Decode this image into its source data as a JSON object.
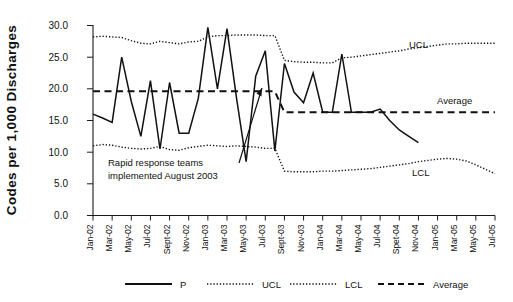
{
  "chart_data": {
    "type": "line",
    "title": "",
    "xlabel": "",
    "ylabel": "Codes per 1,000 Discharges",
    "ylim": [
      0.0,
      30.0
    ],
    "ytick_labels": [
      "0.0",
      "5.0",
      "10.0",
      "15.0",
      "20.0",
      "25.0",
      "30.0"
    ],
    "ytick_values": [
      0.0,
      5.0,
      10.0,
      15.0,
      20.0,
      25.0,
      30.0
    ],
    "grid": false,
    "legend_position": "bottom",
    "categories": [
      "Jan-02",
      "Feb-02",
      "Mar-02",
      "Apr-02",
      "May-02",
      "Jun-02",
      "Jul-02",
      "Aug-02",
      "Sept-02",
      "Oct-02",
      "Nov-02",
      "Dec-02",
      "Jan-03",
      "Feb-03",
      "Mar-03",
      "Apr-03",
      "May-03",
      "Jun-03",
      "Jul-03",
      "Aug-03",
      "Sept-03",
      "Oct-03",
      "Nov-03",
      "Dec-03",
      "Jan-04",
      "Feb-04",
      "Mar-04",
      "Apr-04",
      "May-04",
      "Jun-04",
      "Jul-04",
      "Aug-04",
      "Spet-04",
      "Oct-04",
      "Nov-04",
      "Dec-04",
      "Jan-05",
      "Feb-05",
      "Mar-05",
      "Apr-05",
      "May-05",
      "Jun-05",
      "Jul-05"
    ],
    "xtick_labels": [
      "Jan-02",
      "Mar-02",
      "May-02",
      "Jul-02",
      "Sept-02",
      "Nov-02",
      "Jan-03",
      "Mar-03",
      "May-03",
      "Jul-03",
      "Sept-03",
      "Nov-03",
      "Jan-04",
      "Mar-04",
      "May-04",
      "Jul-04",
      "Spet-04",
      "Nov-04",
      "Jan-05",
      "Mar-05",
      "May-05",
      "Jul-05"
    ],
    "series": [
      {
        "name": "P",
        "style": "solid",
        "values": [
          16.0,
          15.4,
          14.7,
          25.0,
          18.0,
          12.5,
          21.3,
          10.5,
          21.0,
          13.0,
          13.0,
          18.5,
          29.7,
          20.0,
          29.5,
          18.5,
          8.5,
          22.0,
          26.0,
          10.2,
          24.0,
          19.5,
          17.8,
          22.5,
          16.3,
          16.3,
          25.5,
          16.3,
          16.3,
          16.3,
          16.8,
          15.0,
          13.5,
          12.5,
          11.5,
          null,
          null,
          null,
          null,
          null,
          null,
          null,
          null
        ]
      },
      {
        "name": "UCL",
        "style": "dotted",
        "values": [
          28.2,
          28.3,
          28.2,
          28.1,
          27.6,
          27.2,
          27.1,
          27.5,
          27.3,
          27.1,
          27.4,
          27.5,
          28.2,
          28.4,
          28.4,
          28.5,
          28.5,
          28.5,
          28.4,
          28.4,
          24.5,
          24.3,
          24.2,
          24.2,
          24.1,
          24.1,
          24.9,
          25.0,
          25.2,
          25.4,
          25.6,
          25.8,
          26.0,
          26.3,
          26.5,
          26.7,
          26.9,
          27.1,
          27.1,
          27.2,
          27.2,
          27.2,
          27.2
        ]
      },
      {
        "name": "LCL",
        "style": "dotted",
        "values": [
          11.0,
          11.2,
          11.1,
          10.8,
          10.6,
          10.5,
          10.6,
          10.9,
          10.4,
          10.3,
          10.7,
          10.9,
          11.1,
          11.0,
          10.9,
          11.0,
          10.9,
          10.8,
          10.6,
          10.6,
          7.0,
          6.9,
          6.9,
          6.9,
          7.0,
          7.0,
          7.1,
          7.2,
          7.3,
          7.4,
          7.6,
          7.8,
          8.0,
          8.2,
          8.5,
          8.7,
          8.9,
          9.0,
          8.9,
          8.6,
          8.0,
          7.3,
          6.6
        ]
      },
      {
        "name": "Average",
        "style": "dashed",
        "values": [
          19.6,
          19.6,
          19.6,
          19.6,
          19.6,
          19.6,
          19.6,
          19.6,
          19.6,
          19.6,
          19.6,
          19.6,
          19.6,
          19.6,
          19.6,
          19.6,
          19.6,
          19.6,
          19.6,
          19.6,
          16.3,
          16.3,
          16.3,
          16.3,
          16.3,
          16.3,
          16.3,
          16.3,
          16.3,
          16.3,
          16.3,
          16.3,
          16.3,
          16.3,
          16.3,
          16.3,
          16.3,
          16.3,
          16.3,
          16.3,
          16.3,
          16.3,
          16.3
        ]
      }
    ],
    "annotations": [
      {
        "name": "intervention-note",
        "line1": "Rapid response teams",
        "line2": "implemented August 2003",
        "points_to": "Sept-03"
      }
    ],
    "inline_labels": [
      {
        "name": "ucl-label",
        "text": "UCL"
      },
      {
        "name": "average-label",
        "text": "Average"
      },
      {
        "name": "lcl-label",
        "text": "LCL"
      }
    ],
    "legend": [
      {
        "name": "P",
        "style": "solid"
      },
      {
        "name": "UCL",
        "style": "dotted"
      },
      {
        "name": "LCL",
        "style": "dotted"
      },
      {
        "name": "Average",
        "style": "dashed"
      }
    ],
    "colors": {
      "line": "#111111",
      "axis": "#1a1a1a",
      "background": "#ffffff"
    }
  }
}
